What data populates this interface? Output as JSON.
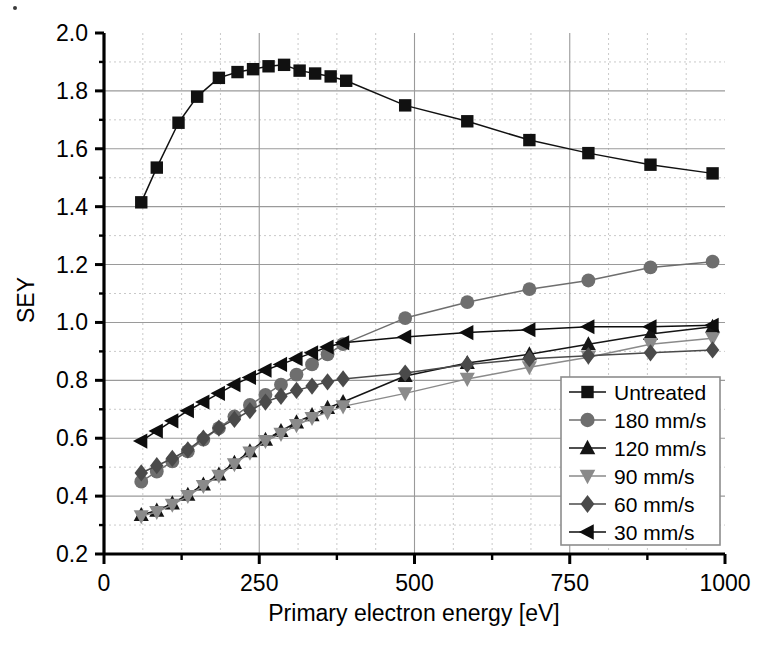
{
  "chart_data": {
    "type": "line",
    "title": "",
    "xlabel": "Primary electron energy [eV]",
    "ylabel": "SEY",
    "xlim": [
      0,
      1000
    ],
    "ylim": [
      0.2,
      2.0
    ],
    "xticks": [
      0,
      250,
      500,
      750,
      1000
    ],
    "xticklabels": [
      "0",
      "250",
      "500",
      "750",
      "1000"
    ],
    "yticks": [
      0.2,
      0.4,
      0.6,
      0.8,
      1.0,
      1.2,
      1.4,
      1.6,
      1.8,
      2.0
    ],
    "yticklabels": [
      "0.2",
      "0.4",
      "0.6",
      "0.8",
      "1.0",
      "1.2",
      "1.4",
      "1.6",
      "1.8",
      "2.0"
    ],
    "grid": "major solid gray, minor dotted gray",
    "minor_x_step": 62.5,
    "minor_y_step": 0.1,
    "legend_position": "lower right",
    "series": [
      {
        "name": "Untreated",
        "marker": "square",
        "color": "#111111",
        "x": [
          60,
          85,
          120,
          150,
          185,
          215,
          240,
          265,
          290,
          315,
          340,
          365,
          390,
          485,
          585,
          685,
          780,
          880,
          980
        ],
        "y": [
          1.415,
          1.535,
          1.69,
          1.78,
          1.845,
          1.865,
          1.875,
          1.885,
          1.89,
          1.87,
          1.86,
          1.85,
          1.835,
          1.75,
          1.695,
          1.63,
          1.585,
          1.545,
          1.515
        ]
      },
      {
        "name": "180 mm/s",
        "marker": "circle",
        "color": "#6e6e6e",
        "x": [
          60,
          85,
          110,
          135,
          160,
          185,
          210,
          235,
          260,
          285,
          310,
          335,
          360,
          385,
          485,
          585,
          685,
          780,
          880,
          980
        ],
        "y": [
          0.45,
          0.485,
          0.52,
          0.555,
          0.595,
          0.635,
          0.675,
          0.715,
          0.75,
          0.785,
          0.82,
          0.855,
          0.89,
          0.925,
          1.015,
          1.07,
          1.115,
          1.145,
          1.19,
          1.21
        ]
      },
      {
        "name": "120 mm/s",
        "marker": "triangle-up",
        "color": "#151515",
        "x": [
          60,
          85,
          110,
          135,
          160,
          185,
          210,
          235,
          260,
          285,
          310,
          335,
          360,
          385,
          485,
          585,
          685,
          780,
          880,
          980
        ],
        "y": [
          0.335,
          0.35,
          0.375,
          0.405,
          0.44,
          0.475,
          0.515,
          0.555,
          0.595,
          0.625,
          0.655,
          0.68,
          0.705,
          0.725,
          0.815,
          0.86,
          0.89,
          0.925,
          0.96,
          0.985
        ]
      },
      {
        "name": "90 mm/s",
        "marker": "triangle-down",
        "color": "#8a8a8a",
        "x": [
          60,
          85,
          110,
          135,
          160,
          185,
          210,
          235,
          260,
          285,
          310,
          335,
          360,
          385,
          485,
          585,
          685,
          780,
          880,
          980
        ],
        "y": [
          0.33,
          0.345,
          0.37,
          0.4,
          0.435,
          0.47,
          0.51,
          0.55,
          0.59,
          0.615,
          0.645,
          0.67,
          0.69,
          0.71,
          0.755,
          0.805,
          0.845,
          0.88,
          0.925,
          0.945
        ]
      },
      {
        "name": "60 mm/s",
        "marker": "diamond",
        "color": "#4a4a4a",
        "x": [
          60,
          85,
          110,
          135,
          160,
          185,
          210,
          235,
          260,
          285,
          310,
          335,
          360,
          385,
          485,
          585,
          685,
          780,
          880,
          980
        ],
        "y": [
          0.48,
          0.505,
          0.53,
          0.56,
          0.6,
          0.635,
          0.665,
          0.695,
          0.725,
          0.745,
          0.765,
          0.78,
          0.795,
          0.805,
          0.825,
          0.855,
          0.875,
          0.885,
          0.895,
          0.905
        ]
      },
      {
        "name": "30 mm/s",
        "marker": "triangle-left",
        "color": "#0d0d0d",
        "x": [
          60,
          85,
          110,
          135,
          160,
          185,
          210,
          235,
          260,
          285,
          310,
          335,
          360,
          385,
          485,
          585,
          685,
          780,
          880,
          980
        ],
        "y": [
          0.59,
          0.625,
          0.66,
          0.695,
          0.725,
          0.755,
          0.785,
          0.81,
          0.835,
          0.855,
          0.875,
          0.895,
          0.915,
          0.93,
          0.95,
          0.965,
          0.975,
          0.985,
          0.985,
          0.99
        ]
      }
    ]
  },
  "legend": {
    "entries": [
      {
        "label": "Untreated"
      },
      {
        "label": "180 mm/s"
      },
      {
        "label": "120 mm/s"
      },
      {
        "label": "90 mm/s"
      },
      {
        "label": "60 mm/s"
      },
      {
        "label": "30 mm/s"
      }
    ]
  },
  "colors": {
    "axis": "#000000",
    "major_grid": "#9a9a9a",
    "minor_grid": "#c9c9c9",
    "background": "#ffffff"
  }
}
